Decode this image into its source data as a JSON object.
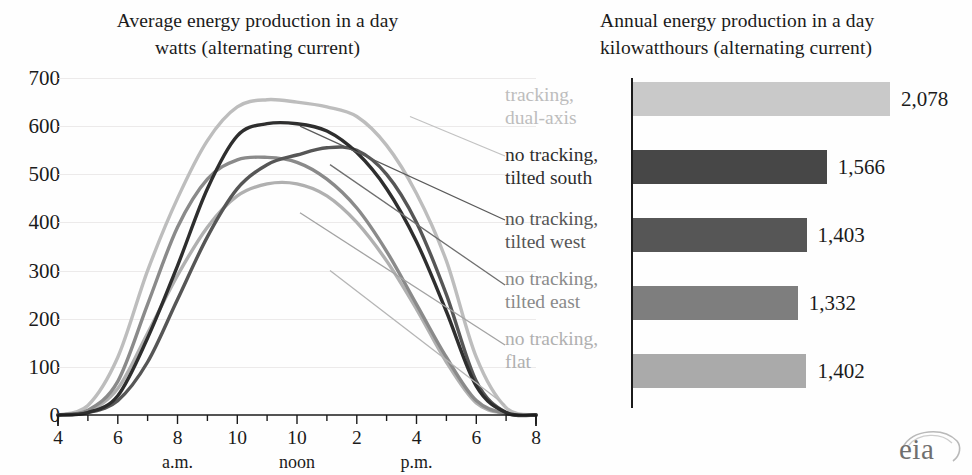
{
  "line_chart": {
    "title_line1": "Average energy production in a day",
    "title_line2": "watts (alternating current)",
    "y_ticks": [
      "700",
      "600",
      "500",
      "400",
      "300",
      "200",
      "100",
      "0"
    ],
    "x_ticks": [
      "4",
      "6",
      "8",
      "10",
      "10",
      "2",
      "4",
      "6",
      "8"
    ],
    "x_periods": [
      "a.m.",
      "noon",
      "p.m."
    ]
  },
  "bar_chart": {
    "title_line1": "Annual energy production in a day",
    "title_line2": "kilowatthours (alternating current)",
    "bars": [
      {
        "label": "tracking, dual-axis",
        "value": 2078,
        "value_label": "2,078",
        "color": "#c9c9c9"
      },
      {
        "label": "no tracking, tilted south",
        "value": 1566,
        "value_label": "1,566",
        "color": "#474747"
      },
      {
        "label": "no tracking, tilted west",
        "value": 1403,
        "value_label": "1,403",
        "color": "#565656"
      },
      {
        "label": "no tracking, tilted east",
        "value": 1332,
        "value_label": "1,332",
        "color": "#7e7e7e"
      },
      {
        "label": "no tracking, flat",
        "value": 1402,
        "value_label": "1,402",
        "color": "#aaaaaa"
      }
    ]
  },
  "legend": [
    {
      "line1": "tracking,",
      "line2": "dual-axis",
      "color": "#bdbdbd"
    },
    {
      "line1": "no tracking,",
      "line2": "tilted south",
      "color": "#2e2e2e"
    },
    {
      "line1": "no tracking,",
      "line2": "tilted west",
      "color": "#565656"
    },
    {
      "line1": "no tracking,",
      "line2": "tilted east",
      "color": "#8a8a8a"
    },
    {
      "line1": "no tracking,",
      "line2": "flat",
      "color": "#b0b0b0"
    }
  ],
  "logo": {
    "text": "eia"
  },
  "chart_data": {
    "type": "line",
    "title": "Average energy production in a day",
    "subtitle": "watts (alternating current)",
    "xlabel": "",
    "ylabel": "watts (alternating current)",
    "ylim": [
      0,
      700
    ],
    "yticks": [
      0,
      100,
      200,
      300,
      400,
      500,
      600,
      700
    ],
    "grid": true,
    "legend_position": "right",
    "x": [
      "4 a.m.",
      "5 a.m.",
      "6 a.m.",
      "7 a.m.",
      "8 a.m.",
      "9 a.m.",
      "10 a.m.",
      "11 a.m.",
      "noon",
      "1 p.m.",
      "2 p.m.",
      "3 p.m.",
      "4 p.m.",
      "5 p.m.",
      "6 p.m.",
      "7 p.m.",
      "8 p.m."
    ],
    "xticks": [
      "4",
      "6",
      "8",
      "10",
      "10",
      "2",
      "4",
      "6",
      "8"
    ],
    "series": [
      {
        "name": "tracking, dual-axis",
        "color": "#bdbdbd",
        "values": [
          0,
          20,
          120,
          300,
          450,
          570,
          640,
          655,
          650,
          640,
          620,
          560,
          460,
          320,
          120,
          15,
          0
        ]
      },
      {
        "name": "no tracking, tilted south",
        "color": "#2e2e2e",
        "values": [
          0,
          5,
          40,
          160,
          310,
          470,
          580,
          605,
          605,
          590,
          545,
          470,
          360,
          215,
          60,
          5,
          0
        ]
      },
      {
        "name": "no tracking, tilted west",
        "color": "#565656",
        "values": [
          0,
          5,
          30,
          110,
          240,
          370,
          470,
          520,
          540,
          555,
          550,
          500,
          400,
          250,
          70,
          5,
          0
        ]
      },
      {
        "name": "no tracking, tilted east",
        "color": "#8a8a8a",
        "values": [
          0,
          10,
          70,
          230,
          390,
          490,
          530,
          535,
          525,
          490,
          430,
          340,
          230,
          120,
          30,
          3,
          0
        ]
      },
      {
        "name": "no tracking, flat",
        "color": "#b0b0b0",
        "values": [
          0,
          8,
          55,
          170,
          290,
          390,
          455,
          480,
          480,
          455,
          400,
          320,
          220,
          110,
          25,
          3,
          0
        ]
      }
    ],
    "secondary_chart": {
      "type": "bar",
      "orientation": "horizontal",
      "title": "Annual energy production in a day",
      "subtitle": "kilowatthours (alternating current)",
      "categories": [
        "tracking, dual-axis",
        "no tracking, tilted south",
        "no tracking, tilted west",
        "no tracking, tilted east",
        "no tracking, flat"
      ],
      "values": [
        2078,
        1566,
        1403,
        1332,
        1402
      ],
      "value_labels": [
        "2,078",
        "1,566",
        "1,403",
        "1,332",
        "1,402"
      ]
    }
  }
}
